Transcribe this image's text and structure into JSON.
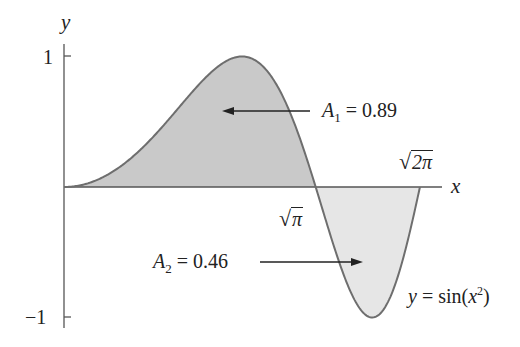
{
  "chart_data": {
    "type": "area",
    "title": "",
    "function": "y = sin(x^2)",
    "xlabel": "x",
    "ylabel": "y",
    "xlim": [
      0,
      2.5066
    ],
    "ylim": [
      -1,
      1
    ],
    "y_ticks": [
      {
        "value": 1,
        "label": "1"
      },
      {
        "value": -1,
        "label": "−1"
      }
    ],
    "x_marks": [
      {
        "value": 1.7725,
        "label": "√π",
        "radicand": "π"
      },
      {
        "value": 2.5066,
        "label": "√2π",
        "radicand": "2π"
      }
    ],
    "regions": [
      {
        "name": "A1",
        "label": "A₁ = 0.89",
        "symbol": "A",
        "subscript": "1",
        "value": 0.89,
        "x_range": [
          0,
          1.7725
        ],
        "fill": "#c9c9c9"
      },
      {
        "name": "A2",
        "label": "A₂ = 0.46",
        "symbol": "A",
        "subscript": "2",
        "value": 0.46,
        "x_range": [
          1.7725,
          2.5066
        ],
        "fill": "#e6e6e6"
      }
    ],
    "curve_label": {
      "lhs": "y",
      "eq": " = sin(",
      "var": "x",
      "exp": "2",
      "close": ")"
    },
    "grid": false,
    "legend": "none",
    "colors": {
      "curve": "#6e6e6e",
      "axis": "#555555",
      "arrow": "#222222"
    }
  }
}
